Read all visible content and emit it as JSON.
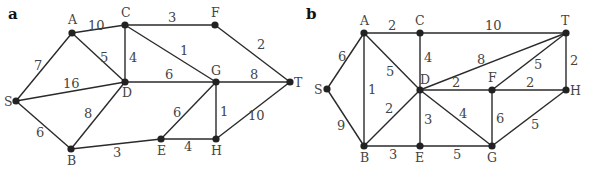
{
  "figure": {
    "panels": [
      {
        "label": "a",
        "label_pos": [
          8,
          19
        ],
        "nodes": [
          {
            "id": "A",
            "x": 72,
            "y": 33,
            "lx": 68,
            "ly": 24
          },
          {
            "id": "C",
            "x": 125,
            "y": 25,
            "lx": 121,
            "ly": 17
          },
          {
            "id": "F",
            "x": 215,
            "y": 25,
            "lx": 211,
            "ly": 17
          },
          {
            "id": "S",
            "x": 16,
            "y": 101,
            "lx": 4,
            "ly": 106
          },
          {
            "id": "D",
            "x": 125,
            "y": 82,
            "lx": 122,
            "ly": 97
          },
          {
            "id": "G",
            "x": 216,
            "y": 82,
            "lx": 211,
            "ly": 75
          },
          {
            "id": "T",
            "x": 290,
            "y": 82,
            "lx": 294,
            "ly": 87
          },
          {
            "id": "B",
            "x": 71,
            "y": 149,
            "lx": 67,
            "ly": 165
          },
          {
            "id": "E",
            "x": 161,
            "y": 139,
            "lx": 157,
            "ly": 155
          },
          {
            "id": "H",
            "x": 216,
            "y": 139,
            "lx": 211,
            "ly": 155
          }
        ],
        "edges": [
          {
            "from": "S",
            "to": "A",
            "w": "7",
            "wx": 34,
            "wy": 70
          },
          {
            "from": "A",
            "to": "C",
            "w": "10",
            "wx": 88,
            "wy": 30
          },
          {
            "from": "A",
            "to": "D",
            "w": "5",
            "wx": 100,
            "wy": 62
          },
          {
            "from": "C",
            "to": "D",
            "w": "4",
            "wx": 129,
            "wy": 62
          },
          {
            "from": "C",
            "to": "F",
            "w": "3",
            "wx": 168,
            "wy": 22
          },
          {
            "from": "C",
            "to": "G",
            "w": "1",
            "wx": 180,
            "wy": 55
          },
          {
            "from": "F",
            "to": "T",
            "w": "2",
            "wx": 257,
            "wy": 49
          },
          {
            "from": "S",
            "to": "D",
            "w": "16",
            "wx": 63,
            "wy": 88
          },
          {
            "from": "D",
            "to": "G",
            "w": "6",
            "wx": 165,
            "wy": 79
          },
          {
            "from": "G",
            "to": "T",
            "w": "8",
            "wx": 250,
            "wy": 79
          },
          {
            "from": "S",
            "to": "B",
            "w": "6",
            "wx": 36,
            "wy": 137
          },
          {
            "from": "D",
            "to": "B",
            "w": "8",
            "wx": 84,
            "wy": 118
          },
          {
            "from": "B",
            "to": "E",
            "w": "3",
            "wx": 113,
            "wy": 157
          },
          {
            "from": "G",
            "to": "E",
            "w": "6",
            "wx": 173,
            "wy": 117
          },
          {
            "from": "G",
            "to": "H",
            "w": "1",
            "wx": 220,
            "wy": 116
          },
          {
            "from": "E",
            "to": "H",
            "w": "4",
            "wx": 184,
            "wy": 151
          },
          {
            "from": "H",
            "to": "T",
            "w": "10",
            "wx": 248,
            "wy": 120
          }
        ]
      },
      {
        "label": "b",
        "label_pos": [
          306,
          19
        ],
        "nodes": [
          {
            "id": "A",
            "x": 364,
            "y": 33,
            "lx": 360,
            "ly": 25
          },
          {
            "id": "C",
            "x": 420,
            "y": 33,
            "lx": 415,
            "ly": 25
          },
          {
            "id": "T",
            "x": 566,
            "y": 33,
            "lx": 561,
            "ly": 25
          },
          {
            "id": "S",
            "x": 327,
            "y": 89,
            "lx": 314,
            "ly": 94
          },
          {
            "id": "D",
            "x": 420,
            "y": 90,
            "lx": 420,
            "ly": 84
          },
          {
            "id": "F",
            "x": 492,
            "y": 90,
            "lx": 488,
            "ly": 82
          },
          {
            "id": "H",
            "x": 566,
            "y": 90,
            "lx": 570,
            "ly": 95
          },
          {
            "id": "B",
            "x": 364,
            "y": 146,
            "lx": 360,
            "ly": 162
          },
          {
            "id": "E",
            "x": 420,
            "y": 146,
            "lx": 415,
            "ly": 162
          },
          {
            "id": "G",
            "x": 492,
            "y": 146,
            "lx": 487,
            "ly": 162
          }
        ],
        "edges": [
          {
            "from": "S",
            "to": "A",
            "w": "6",
            "wx": 338,
            "wy": 61
          },
          {
            "from": "A",
            "to": "C",
            "w": "2",
            "wx": 388,
            "wy": 30
          },
          {
            "from": "A",
            "to": "D",
            "w": "5",
            "wx": 386,
            "wy": 76
          },
          {
            "from": "A",
            "to": "B",
            "w": "1",
            "wx": 368,
            "wy": 94
          },
          {
            "from": "C",
            "to": "D",
            "w": "4",
            "wx": 424,
            "wy": 62
          },
          {
            "from": "C",
            "to": "T",
            "w": "10",
            "wx": 485,
            "wy": 30
          },
          {
            "from": "D",
            "to": "T",
            "w": "8",
            "wx": 477,
            "wy": 64
          },
          {
            "from": "D",
            "to": "F",
            "w": "2",
            "wx": 452,
            "wy": 87
          },
          {
            "from": "F",
            "to": "T",
            "w": "5",
            "wx": 534,
            "wy": 69
          },
          {
            "from": "T",
            "to": "H",
            "w": "2",
            "wx": 570,
            "wy": 65
          },
          {
            "from": "F",
            "to": "H",
            "w": "2",
            "wx": 526,
            "wy": 87
          },
          {
            "from": "S",
            "to": "B",
            "w": "9",
            "wx": 337,
            "wy": 130
          },
          {
            "from": "D",
            "to": "B",
            "w": "2",
            "wx": 385,
            "wy": 113
          },
          {
            "from": "D",
            "to": "E",
            "w": "3",
            "wx": 424,
            "wy": 124
          },
          {
            "from": "D",
            "to": "G",
            "w": "4",
            "wx": 459,
            "wy": 118
          },
          {
            "from": "F",
            "to": "G",
            "w": "6",
            "wx": 496,
            "wy": 123
          },
          {
            "from": "H",
            "to": "G",
            "w": "5",
            "wx": 531,
            "wy": 129
          },
          {
            "from": "B",
            "to": "E",
            "w": "3",
            "wx": 389,
            "wy": 159
          },
          {
            "from": "E",
            "to": "G",
            "w": "5",
            "wx": 453,
            "wy": 159
          }
        ]
      }
    ]
  }
}
